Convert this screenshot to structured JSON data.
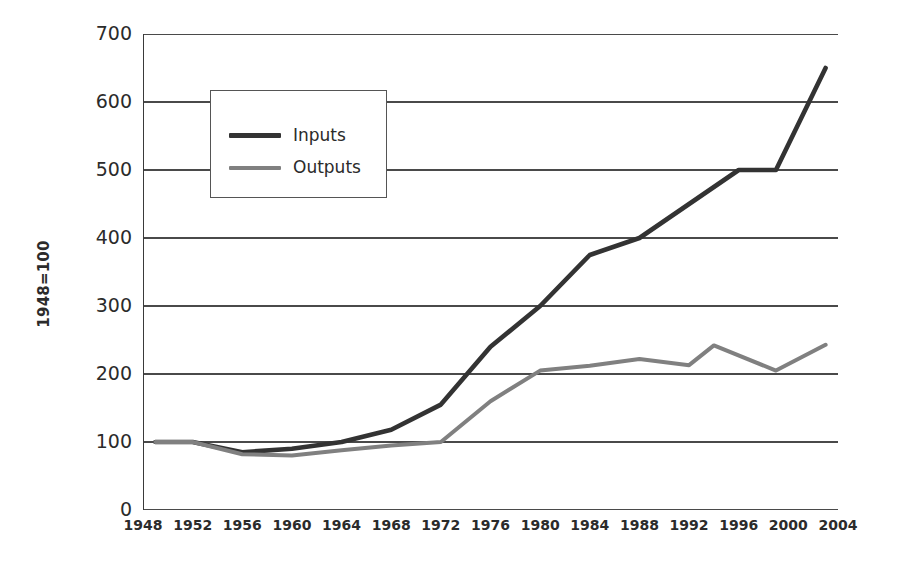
{
  "chart_data": {
    "type": "line",
    "title": "",
    "subtitle": "",
    "xlabel": "",
    "ylabel": "1948=100",
    "xlim": [
      1948,
      2004
    ],
    "ylim": [
      0,
      700
    ],
    "grid": true,
    "legend_position": "upper-left-inset",
    "y_ticks": [
      700,
      600,
      500,
      400,
      300,
      200,
      100,
      0
    ],
    "x_ticks": [
      1948,
      1952,
      1956,
      1960,
      1964,
      1968,
      1972,
      1976,
      1980,
      1984,
      1988,
      1992,
      1996,
      2000,
      2004
    ],
    "series": [
      {
        "name": "Inputs",
        "color": "#333333",
        "x": [
          1949,
          1952,
          1956,
          1960,
          1964,
          1968,
          1972,
          1976,
          1980,
          1984,
          1988,
          1992,
          1996,
          1999,
          2003
        ],
        "values": [
          100,
          100,
          85,
          90,
          100,
          118,
          155,
          240,
          300,
          375,
          400,
          450,
          500,
          500,
          650
        ]
      },
      {
        "name": "Outputs",
        "color": "#808080",
        "x": [
          1949,
          1952,
          1956,
          1960,
          1964,
          1968,
          1972,
          1976,
          1980,
          1984,
          1988,
          1992,
          1994,
          1999,
          2003
        ],
        "values": [
          100,
          100,
          82,
          80,
          88,
          95,
          100,
          160,
          205,
          212,
          222,
          213,
          242,
          205,
          243
        ]
      }
    ]
  },
  "legend": {
    "items": [
      {
        "label": "Inputs",
        "color": "#333333"
      },
      {
        "label": "Outputs",
        "color": "#808080"
      }
    ]
  },
  "axes": {
    "y_title": "1948=100"
  }
}
